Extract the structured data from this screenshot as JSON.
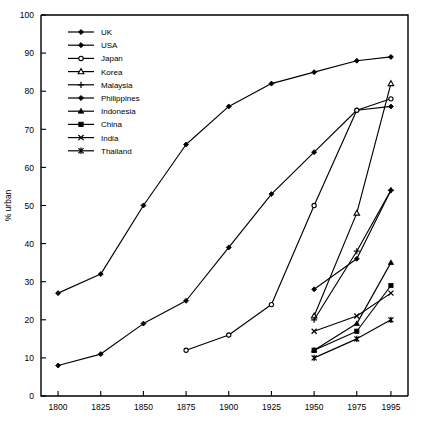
{
  "chart_data": {
    "type": "line",
    "title": "",
    "xlabel": "",
    "ylabel": "% urban",
    "xlim": [
      1790,
      2005
    ],
    "ylim": [
      0,
      100
    ],
    "grid": false,
    "legend_position": "top-left inside plot",
    "x_ticks": [
      1800,
      1825,
      1850,
      1875,
      1900,
      1925,
      1950,
      1975,
      1995
    ],
    "y_ticks": [
      0,
      10,
      20,
      30,
      40,
      50,
      60,
      70,
      80,
      90,
      100
    ],
    "series": [
      {
        "name": "UK",
        "marker": "filled-diamond",
        "x": [
          1800,
          1825,
          1850,
          1875,
          1900,
          1925,
          1950,
          1975,
          1995
        ],
        "values": [
          27,
          32,
          50,
          66,
          76,
          82,
          85,
          88,
          89
        ]
      },
      {
        "name": "USA",
        "marker": "filled-diamond",
        "x": [
          1800,
          1825,
          1850,
          1875,
          1900,
          1925,
          1950,
          1975,
          1995
        ],
        "values": [
          8,
          11,
          19,
          25,
          39,
          53,
          64,
          75,
          76
        ]
      },
      {
        "name": "Japan",
        "marker": "open-circle",
        "x": [
          1875,
          1900,
          1925,
          1950,
          1975,
          1995
        ],
        "values": [
          12,
          16,
          24,
          50,
          75,
          78
        ]
      },
      {
        "name": "Korea",
        "marker": "open-triangle",
        "x": [
          1950,
          1975,
          1995
        ],
        "values": [
          21,
          48,
          82
        ]
      },
      {
        "name": "Malaysia",
        "marker": "plus",
        "x": [
          1950,
          1975,
          1995
        ],
        "values": [
          20,
          38,
          54
        ]
      },
      {
        "name": "Philippines",
        "marker": "filled-diamond",
        "x": [
          1950,
          1975,
          1995
        ],
        "values": [
          28,
          36,
          54
        ]
      },
      {
        "name": "Indonesia",
        "marker": "filled-triangle",
        "x": [
          1950,
          1975,
          1995
        ],
        "values": [
          12,
          19,
          35
        ]
      },
      {
        "name": "China",
        "marker": "filled-square",
        "x": [
          1950,
          1975,
          1995
        ],
        "values": [
          12,
          17,
          29
        ]
      },
      {
        "name": "India",
        "marker": "x-cross",
        "x": [
          1950,
          1975,
          1995
        ],
        "values": [
          17,
          21,
          27
        ]
      },
      {
        "name": "Thailand",
        "marker": "asterisk",
        "x": [
          1950,
          1975,
          1995
        ],
        "values": [
          10,
          15,
          20
        ]
      }
    ]
  },
  "legend": {
    "items": [
      {
        "label": "UK",
        "marker": "filled-diamond"
      },
      {
        "label": "USA",
        "marker": "filled-diamond"
      },
      {
        "label": "Japan",
        "marker": "open-circle"
      },
      {
        "label": "Korea",
        "marker": "open-triangle"
      },
      {
        "label": "Malaysia",
        "marker": "plus"
      },
      {
        "label": "Philippines",
        "marker": "filled-diamond"
      },
      {
        "label": "Indonesia",
        "marker": "filled-triangle"
      },
      {
        "label": "China",
        "marker": "filled-square"
      },
      {
        "label": "India",
        "marker": "x-cross"
      },
      {
        "label": "Thailand",
        "marker": "asterisk"
      }
    ]
  },
  "axes": {
    "y_title": "% urban",
    "x_tick_labels": [
      "1800",
      "1825",
      "1850",
      "1875",
      "1900",
      "1925",
      "1950",
      "1975",
      "1995"
    ],
    "y_tick_labels": [
      "0",
      "10",
      "20",
      "30",
      "40",
      "50",
      "60",
      "70",
      "80",
      "90",
      "100"
    ]
  },
  "colors": {
    "ink": "#000000",
    "background": "#ffffff"
  }
}
